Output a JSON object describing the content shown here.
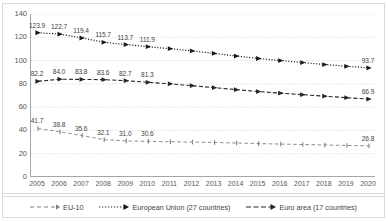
{
  "chart_data": {
    "type": "line",
    "title": "",
    "subtitle": "",
    "xlabel": "",
    "ylabel": "",
    "x": [
      2005,
      2006,
      2007,
      2008,
      2009,
      2010,
      2011,
      2012,
      2013,
      2014,
      2015,
      2016,
      2017,
      2018,
      2019,
      2020
    ],
    "xtick_labels": [
      "2005",
      "2006",
      "2007",
      "2008",
      "2009",
      "2010",
      "2011",
      "2012",
      "2013",
      "2014",
      "2015",
      "2016",
      "2017",
      "2018",
      "2019",
      "2020"
    ],
    "ytick_labels": [
      "0",
      "20",
      "40",
      "60",
      "80",
      "100",
      "120",
      "140"
    ],
    "yticks": [
      0,
      20,
      40,
      60,
      80,
      100,
      120,
      140
    ],
    "ylim": [
      0,
      140
    ],
    "xlim": [
      2005,
      2020
    ],
    "grid": true,
    "grid_axis": "y",
    "legend_position": "bottom",
    "series": [
      {
        "name": "EU-10",
        "style": "dashed-light",
        "color": "#808080",
        "values": [
          41.7,
          38.8,
          35.6,
          32.1,
          31.0,
          30.6,
          30.3,
          30.0,
          29.6,
          29.2,
          28.7,
          28.3,
          27.9,
          27.5,
          27.1,
          26.8
        ],
        "labels": [
          "41.7",
          "38.8",
          "35.6",
          "32.1",
          "31.0",
          "30.6",
          "",
          "",
          "",
          "",
          "",
          "",
          "",
          "",
          "",
          "26.8"
        ]
      },
      {
        "name": "European Union (27 countries)",
        "style": "dotted-dark",
        "color": "#1a1a1a",
        "values": [
          123.9,
          122.7,
          119.4,
          115.7,
          113.7,
          111.9,
          110.2,
          108.3,
          106.1,
          103.9,
          101.8,
          100.0,
          98.3,
          96.6,
          95.1,
          93.7
        ],
        "labels": [
          "123.9",
          "122.7",
          "119.4",
          "115.7",
          "113.7",
          "111.9",
          "",
          "",
          "",
          "",
          "",
          "",
          "",
          "",
          "",
          "93.7"
        ]
      },
      {
        "name": "Euro area (17 countries)",
        "style": "dashdot-dark",
        "color": "#262626",
        "values": [
          82.2,
          84.0,
          83.8,
          83.6,
          82.7,
          81.3,
          80.0,
          78.4,
          76.7,
          75.0,
          73.4,
          72.0,
          70.7,
          69.4,
          68.1,
          66.9
        ],
        "labels": [
          "82.2",
          "84.0",
          "83.8",
          "83.6",
          "82.7",
          "81.3",
          "",
          "",
          "",
          "",
          "",
          "",
          "",
          "",
          "",
          "66.9"
        ]
      }
    ]
  },
  "legend": {
    "items": [
      {
        "label": "EU-10"
      },
      {
        "label": "European Union (27 countries)"
      },
      {
        "label": "Euro area (17 countries)"
      }
    ]
  },
  "colors": {
    "grid": "#d0d0d0",
    "axis": "#a6a6a6",
    "text": "#595959",
    "series_light": "#808080",
    "series_dark": "#1a1a1a"
  }
}
